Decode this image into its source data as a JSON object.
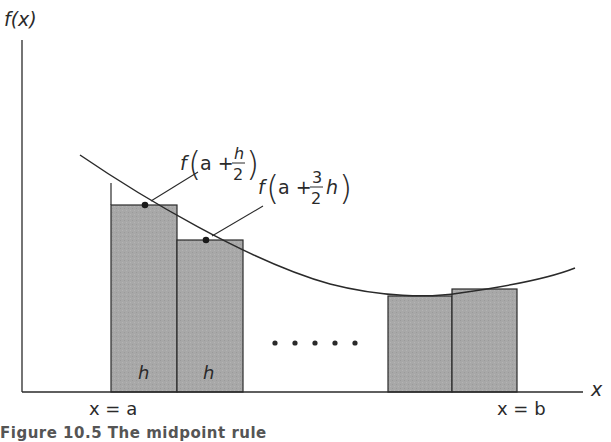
{
  "diagram": {
    "axes": {
      "y_label": "f(x)",
      "x_label": "x"
    },
    "bounds": {
      "left_label": "x = a",
      "right_label": "x = b"
    },
    "annotations": [
      {
        "id": "first-midpoint",
        "text": "f(a + h/2)",
        "f": "f",
        "arg_prefix": "a +",
        "num": "h",
        "den": "2",
        "suffix": ""
      },
      {
        "id": "second-midpoint",
        "text": "f(a + 3/2 h)",
        "f": "f",
        "arg_prefix": "a +",
        "num": "3",
        "den": "2",
        "suffix": "h"
      }
    ],
    "width_labels": [
      "h",
      "h"
    ],
    "ellipsis": "• • • • •",
    "caption": "Figure 10.5  The midpoint rule",
    "colors": {
      "rectangle_fill": "#a9a9a9",
      "stroke": "#2a2a2a",
      "background": "#ffffff"
    }
  }
}
